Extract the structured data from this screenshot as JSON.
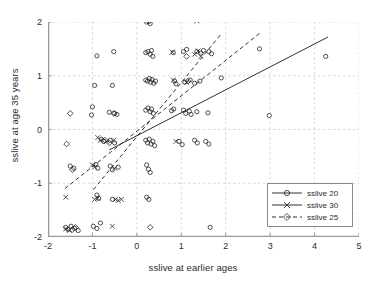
{
  "chart_data": {
    "type": "scatter",
    "title": "",
    "xlabel": "sslive at earlier ages",
    "ylabel": "sslive at age 35 years",
    "xlim": [
      -2,
      5
    ],
    "ylim": [
      -2,
      2
    ],
    "xticks": [
      -2,
      -1,
      0,
      1,
      2,
      3,
      4,
      5
    ],
    "yticks": [
      -2,
      -1,
      0,
      1,
      2
    ],
    "xtick_labels": [
      "-2",
      "-1",
      "0",
      "1",
      "2",
      "3",
      "4",
      "5"
    ],
    "ytick_labels": [
      "-2",
      "-1",
      "0",
      "1",
      "2"
    ],
    "grid": true,
    "grid_style": "dashed",
    "grid_color": "#c8c8c8",
    "axis_color": "#9a9a9a",
    "marker_color": "#1a1a1a",
    "legend_position": "lower right",
    "legend": [
      {
        "label": "sslive 20",
        "marker": "circle",
        "line": "solid"
      },
      {
        "label": "sslive 30",
        "marker": "cross",
        "line": "solid"
      },
      {
        "label": "sslive 25",
        "marker": "diamond",
        "line": "dashed"
      }
    ],
    "series": [
      {
        "name": "sslive 20",
        "marker": "circle",
        "points": [
          [
            0.22,
            2.0
          ],
          [
            0.27,
            2.01
          ],
          [
            0.3,
            1.97
          ],
          [
            -0.9,
            1.37
          ],
          [
            -0.52,
            1.45
          ],
          [
            0.2,
            1.43
          ],
          [
            0.25,
            1.45
          ],
          [
            0.3,
            1.4
          ],
          [
            0.33,
            1.47
          ],
          [
            0.36,
            1.36
          ],
          [
            0.82,
            1.43
          ],
          [
            1.05,
            1.45
          ],
          [
            1.12,
            1.49
          ],
          [
            1.35,
            1.45
          ],
          [
            1.44,
            1.42
          ],
          [
            1.5,
            1.47
          ],
          [
            1.62,
            1.45
          ],
          [
            1.68,
            1.41
          ],
          [
            2.76,
            1.5
          ],
          [
            4.25,
            1.36
          ],
          [
            -0.95,
            0.82
          ],
          [
            -0.55,
            0.82
          ],
          [
            0.2,
            0.92
          ],
          [
            0.24,
            0.9
          ],
          [
            0.28,
            0.95
          ],
          [
            0.31,
            0.88
          ],
          [
            0.34,
            0.93
          ],
          [
            0.38,
            0.86
          ],
          [
            0.42,
            0.9
          ],
          [
            0.85,
            0.9
          ],
          [
            0.88,
            0.85
          ],
          [
            1.08,
            0.88
          ],
          [
            1.2,
            0.92
          ],
          [
            1.3,
            0.86
          ],
          [
            1.42,
            0.9
          ],
          [
            1.9,
            0.96
          ],
          [
            -1.0,
            0.42
          ],
          [
            -1.02,
            0.27
          ],
          [
            -0.62,
            0.32
          ],
          [
            -0.5,
            0.3
          ],
          [
            -0.45,
            0.28
          ],
          [
            0.2,
            0.36
          ],
          [
            0.25,
            0.4
          ],
          [
            0.3,
            0.33
          ],
          [
            0.33,
            0.38
          ],
          [
            0.37,
            0.3
          ],
          [
            0.78,
            0.35
          ],
          [
            0.83,
            0.38
          ],
          [
            1.05,
            0.36
          ],
          [
            1.1,
            0.3
          ],
          [
            1.18,
            0.34
          ],
          [
            1.22,
            0.28
          ],
          [
            1.35,
            0.33
          ],
          [
            1.6,
            0.31
          ],
          [
            2.98,
            0.26
          ],
          [
            -0.8,
            -0.18
          ],
          [
            -0.75,
            -0.22
          ],
          [
            -0.6,
            -0.2
          ],
          [
            -0.5,
            -0.25
          ],
          [
            0.2,
            -0.2
          ],
          [
            0.24,
            -0.25
          ],
          [
            0.28,
            -0.18
          ],
          [
            0.32,
            -0.27
          ],
          [
            0.36,
            -0.22
          ],
          [
            0.4,
            -0.3
          ],
          [
            0.95,
            -0.22
          ],
          [
            1.02,
            -0.28
          ],
          [
            1.3,
            -0.2
          ],
          [
            1.36,
            -0.25
          ],
          [
            1.55,
            -0.22
          ],
          [
            1.62,
            -0.27
          ],
          [
            -1.42,
            -0.72
          ],
          [
            -1.5,
            -0.68
          ],
          [
            -0.92,
            -0.65
          ],
          [
            -0.88,
            -0.72
          ],
          [
            -0.6,
            -0.68
          ],
          [
            -0.55,
            -0.75
          ],
          [
            -0.42,
            -0.7
          ],
          [
            0.22,
            -0.66
          ],
          [
            0.26,
            -0.74
          ],
          [
            0.3,
            -0.8
          ],
          [
            -0.9,
            -1.22
          ],
          [
            -0.86,
            -1.28
          ],
          [
            -0.55,
            -1.3
          ],
          [
            0.22,
            -1.26
          ],
          [
            0.27,
            -1.3
          ],
          [
            -1.6,
            -1.82
          ],
          [
            -1.55,
            -1.86
          ],
          [
            -1.48,
            -1.8
          ],
          [
            -1.4,
            -1.84
          ],
          [
            -1.32,
            -1.88
          ],
          [
            -0.98,
            -1.8
          ],
          [
            -0.9,
            -1.84
          ],
          [
            -0.82,
            -1.74
          ],
          [
            1.65,
            -1.82
          ]
        ]
      },
      {
        "name": "sslive 30",
        "marker": "cross",
        "points": [
          [
            1.35,
            2.02
          ],
          [
            0.8,
            1.44
          ],
          [
            1.3,
            1.4
          ],
          [
            1.38,
            1.46
          ],
          [
            1.44,
            1.36
          ],
          [
            0.82,
            0.92
          ],
          [
            1.12,
            0.88
          ],
          [
            -0.88,
            -0.15
          ],
          [
            -0.82,
            -0.2
          ],
          [
            -0.68,
            -0.22
          ],
          [
            -0.52,
            -0.2
          ],
          [
            0.88,
            -0.22
          ],
          [
            -1.0,
            -0.66
          ],
          [
            -0.95,
            -0.7
          ],
          [
            -0.5,
            -0.72
          ],
          [
            -1.6,
            -1.26
          ],
          [
            -0.95,
            -1.3
          ],
          [
            -0.88,
            -1.28
          ],
          [
            -0.48,
            -1.3
          ],
          [
            -0.42,
            -1.32
          ],
          [
            -0.35,
            -1.3
          ],
          [
            -1.6,
            -1.85
          ],
          [
            -1.52,
            -1.88
          ],
          [
            -0.55,
            -1.8
          ]
        ]
      },
      {
        "name": "sslive 25",
        "marker": "diamond",
        "points": [
          [
            -1.5,
            0.3
          ],
          [
            -0.52,
            0.3
          ],
          [
            1.12,
            1.36
          ],
          [
            1.15,
            0.9
          ],
          [
            -0.72,
            -0.2
          ],
          [
            -0.62,
            -0.25
          ],
          [
            -1.58,
            -0.27
          ],
          [
            -1.45,
            -0.75
          ],
          [
            0.3,
            -1.82
          ],
          [
            -1.45,
            -1.86
          ],
          [
            -1.38,
            -1.82
          ]
        ]
      }
    ],
    "fit_lines": [
      {
        "name": "sslive 20",
        "style": "solid",
        "x": [
          -0.62,
          4.3
        ],
        "y": [
          -0.38,
          1.72
        ]
      },
      {
        "name": "sslive 30",
        "style": "dashed",
        "x": [
          -0.98,
          1.9
        ],
        "y": [
          -1.12,
          1.78
        ]
      },
      {
        "name": "sslive 25",
        "style": "dashed",
        "x": [
          -1.62,
          2.78
        ],
        "y": [
          -1.1,
          1.8
        ]
      }
    ]
  }
}
